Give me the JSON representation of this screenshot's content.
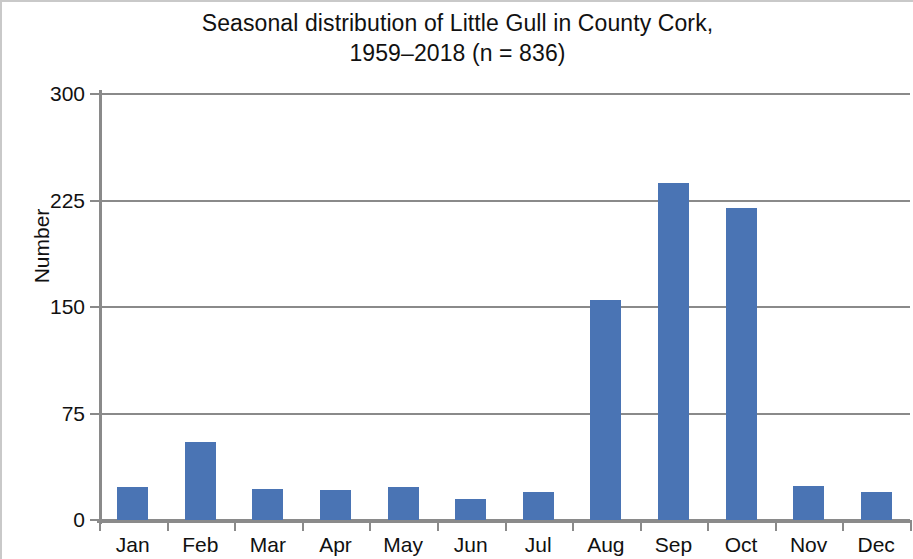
{
  "chart_data": {
    "type": "bar",
    "title": "Seasonal distribution of Little Gull in County Cork,\n1959–2018 (n = 836)",
    "title_line1": "Seasonal distribution of Little Gull in County Cork,",
    "title_line2": "1959–2018 (n = 836)",
    "xlabel": "",
    "ylabel": "Number",
    "categories": [
      "Jan",
      "Feb",
      "Mar",
      "Apr",
      "May",
      "Jun",
      "Jul",
      "Aug",
      "Sep",
      "Oct",
      "Nov",
      "Dec"
    ],
    "values": [
      23,
      55,
      22,
      21,
      23,
      15,
      20,
      155,
      237,
      220,
      24,
      20
    ],
    "ylim": [
      0,
      300
    ],
    "yticks": [
      0,
      75,
      150,
      225,
      300
    ],
    "ytick_labels": [
      "0",
      "75",
      "150",
      "225",
      "300"
    ],
    "grid": "horizontal",
    "legend": "none",
    "series_color": "#4a74b4",
    "axis_color": "#8a8a8a",
    "sample_size": 836,
    "year_range": "1959–2018"
  }
}
